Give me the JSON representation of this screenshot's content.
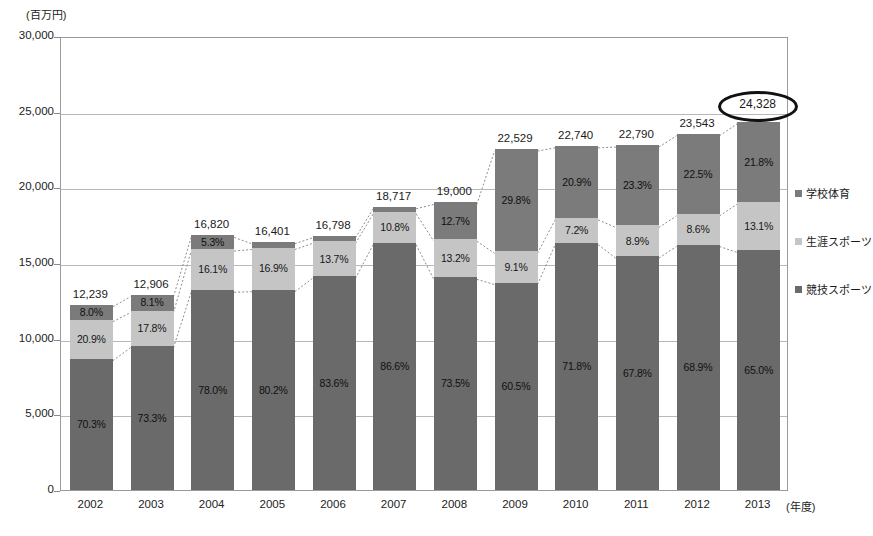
{
  "chart_data": {
    "type": "bar",
    "subtype": "stacked-bar-100-percent-labels",
    "title": "",
    "xlabel": "(年度)",
    "ylabel": "(百万円)",
    "ylim": [
      0,
      30000
    ],
    "y_tick_step": 5000,
    "y_ticks": [
      "30,000",
      "25,000",
      "20,000",
      "15,000",
      "10,000",
      "5,000",
      "0"
    ],
    "y_tick_values": [
      30000,
      25000,
      20000,
      15000,
      10000,
      5000,
      0
    ],
    "grid": true,
    "legend_position": "right",
    "categories": [
      "2002",
      "2003",
      "2004",
      "2005",
      "2006",
      "2007",
      "2008",
      "2009",
      "2010",
      "2011",
      "2012",
      "2013"
    ],
    "totals": [
      12239,
      12906,
      16820,
      16401,
      16798,
      18717,
      19000,
      22529,
      22740,
      22790,
      23543,
      24328
    ],
    "total_labels": [
      "12,239",
      "12,906",
      "16,820",
      "16,401",
      "16,798",
      "18,717",
      "19,000",
      "22,529",
      "22,740",
      "22,790",
      "23,543",
      "24,328"
    ],
    "series": [
      {
        "name": "学校体育",
        "key": "top",
        "color": "#7b7b7b",
        "percent_values": [
          8.0,
          8.1,
          5.3,
          2.3,
          2.2,
          1.8,
          12.7,
          29.8,
          20.9,
          23.3,
          22.5,
          21.8
        ],
        "percent_labels": [
          "8.0%",
          "8.1%",
          "5.3%",
          "2.3%",
          "2.2%",
          "1.8%",
          "12.7%",
          "29.8%",
          "20.9%",
          "23.3%",
          "22.5%",
          "21.8%"
        ]
      },
      {
        "name": "生涯スポーツ",
        "key": "mid",
        "color": "#c5c5c5",
        "percent_values": [
          20.9,
          17.8,
          16.1,
          16.9,
          13.7,
          10.8,
          13.2,
          9.1,
          7.2,
          8.9,
          8.6,
          13.1
        ],
        "percent_labels": [
          "20.9%",
          "17.8%",
          "16.1%",
          "16.9%",
          "13.7%",
          "10.8%",
          "13.2%",
          "9.1%",
          "7.2%",
          "8.9%",
          "8.6%",
          "13.1%"
        ]
      },
      {
        "name": "競技スポーツ",
        "key": "bot",
        "color": "#6a6a6a",
        "percent_values": [
          70.3,
          73.3,
          78.0,
          80.2,
          83.6,
          86.6,
          73.5,
          60.5,
          71.8,
          67.8,
          68.9,
          65.0
        ],
        "percent_labels": [
          "70.3%",
          "73.3%",
          "78.0%",
          "80.2%",
          "83.6%",
          "86.6%",
          "73.5%",
          "60.5%",
          "71.8%",
          "67.8%",
          "68.9%",
          "65.0%"
        ]
      }
    ],
    "annotations": [
      {
        "type": "ellipse-highlight",
        "target_category": "2013",
        "text": "24,328"
      }
    ]
  },
  "legend": {
    "items": [
      {
        "label": "学校体育",
        "color": "#7b7b7b"
      },
      {
        "label": "生涯スポーツ",
        "color": "#c5c5c5"
      },
      {
        "label": "競技スポーツ",
        "color": "#6a6a6a"
      }
    ]
  }
}
